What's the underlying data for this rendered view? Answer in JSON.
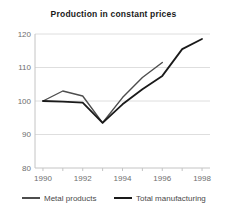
{
  "chart_data": {
    "type": "line",
    "title": "Production in constant prices",
    "xlabel": "",
    "ylabel": "",
    "xlim": [
      1989.6,
      1998.4
    ],
    "ylim": [
      80,
      120
    ],
    "y_ticks": [
      80,
      90,
      100,
      110,
      120
    ],
    "x_ticks": [
      1990,
      1992,
      1994,
      1996,
      1998
    ],
    "x_minor_ticks": [
      1990,
      1991,
      1992,
      1993,
      1994,
      1995,
      1996,
      1997,
      1998
    ],
    "grid": "horizontal",
    "legend_position": "bottom",
    "series": [
      {
        "name": "Metal products",
        "color": "#4d4d4d",
        "width": 1.4,
        "x": [
          1990,
          1991,
          1992,
          1993,
          1994,
          1995,
          1996
        ],
        "values": [
          100,
          103,
          101.5,
          93.5,
          101,
          107,
          111.5
        ]
      },
      {
        "name": "Total manufacturing",
        "color": "#1a1a1a",
        "width": 1.8,
        "x": [
          1990,
          1991,
          1992,
          1993,
          1994,
          1995,
          1996,
          1997,
          1998
        ],
        "values": [
          100,
          99.8,
          99.5,
          93.5,
          99,
          103.5,
          107.5,
          115.5,
          118.5
        ]
      }
    ]
  },
  "colors": {
    "background": "#ffffff",
    "grid": "#dedede",
    "axis": "#c4c4c4",
    "tick_label": "#6e6e6e",
    "title": "#1a1a1a",
    "legend_text": "#4a4a4a"
  }
}
